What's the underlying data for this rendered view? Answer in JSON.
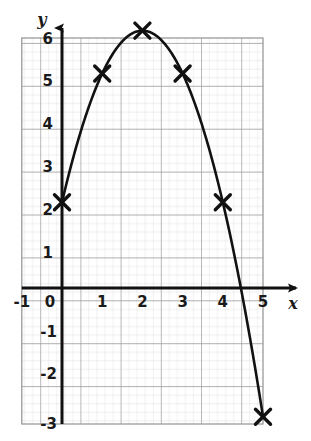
{
  "chart_data": {
    "type": "line",
    "title": "",
    "subtitle": "",
    "xlabel": "x",
    "ylabel": "y",
    "xlim": [
      -1,
      5
    ],
    "ylim": [
      -3,
      6
    ],
    "grid": true,
    "minor_grid": true,
    "minor_grid_divisions": 5,
    "legend": null,
    "legend_position": "none",
    "curve_equation": "y = -x^2 + 4x + 2",
    "x_ticks": [
      -1,
      0,
      1,
      2,
      3,
      4,
      5
    ],
    "x_tick_labels": [
      "-1",
      "0",
      "1",
      "2",
      "3",
      "4",
      "5"
    ],
    "y_ticks": [
      -3,
      -2,
      -1,
      0,
      1,
      2,
      3,
      4,
      5,
      6
    ],
    "y_tick_labels": [
      "-3",
      "-2",
      "-1",
      "0",
      "1",
      "2",
      "3",
      "4",
      "5",
      "6"
    ],
    "origin_label": "0",
    "marker_style": "x-cross",
    "points": [
      {
        "x": 0,
        "y": 2,
        "label": "(0, 2)"
      },
      {
        "x": 1,
        "y": 5,
        "label": "(1, 5)"
      },
      {
        "x": 2,
        "y": 6,
        "label": "(2, 6)"
      },
      {
        "x": 3,
        "y": 5,
        "label": "(3, 5)"
      },
      {
        "x": 4,
        "y": 2,
        "label": "(4, 2)"
      },
      {
        "x": 5,
        "y": -3,
        "label": "(5, -3)"
      }
    ],
    "series": [
      {
        "name": "parabola",
        "x": [
          0,
          1,
          2,
          3,
          4,
          5
        ],
        "values": [
          2,
          5,
          6,
          5,
          2,
          -3
        ]
      }
    ],
    "x_intercept_approx": 4.55,
    "y_intercept": 2,
    "vertex": {
      "x": 2,
      "y": 6
    }
  },
  "colors": {
    "curve": "#111111",
    "axis": "#111111",
    "major_grid": "#9a9a9a",
    "minor_grid": "#cccccc",
    "plot_background": "#ffffff",
    "text": "#1a1a1a"
  },
  "axes": {
    "x_axis_name": "x",
    "y_axis_name": "y"
  }
}
